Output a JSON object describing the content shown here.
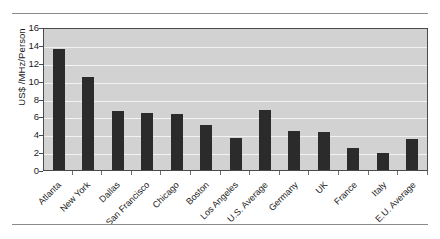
{
  "chart_data": {
    "type": "bar",
    "title": "",
    "xlabel": "",
    "ylabel": "US$ /MHz/Person",
    "ylim": [
      0,
      16
    ],
    "yticks": [
      16,
      14,
      12,
      10,
      8,
      6,
      4,
      2,
      0
    ],
    "grid": true,
    "legend": false,
    "bar_color": "#2b2b2b",
    "plot_background": "#d2d2d2",
    "categories": [
      "Atlanta",
      "New York",
      "Dallas",
      "San Francisco",
      "Chicago",
      "Boston",
      "Los Angeles",
      "U.S. Average",
      "Germany",
      "UK",
      "France",
      "Italy",
      "E.U. Average"
    ],
    "values": [
      13.5,
      10.4,
      6.6,
      6.35,
      6.25,
      5.0,
      3.6,
      6.75,
      4.35,
      4.2,
      2.5,
      1.9,
      3.5
    ]
  }
}
